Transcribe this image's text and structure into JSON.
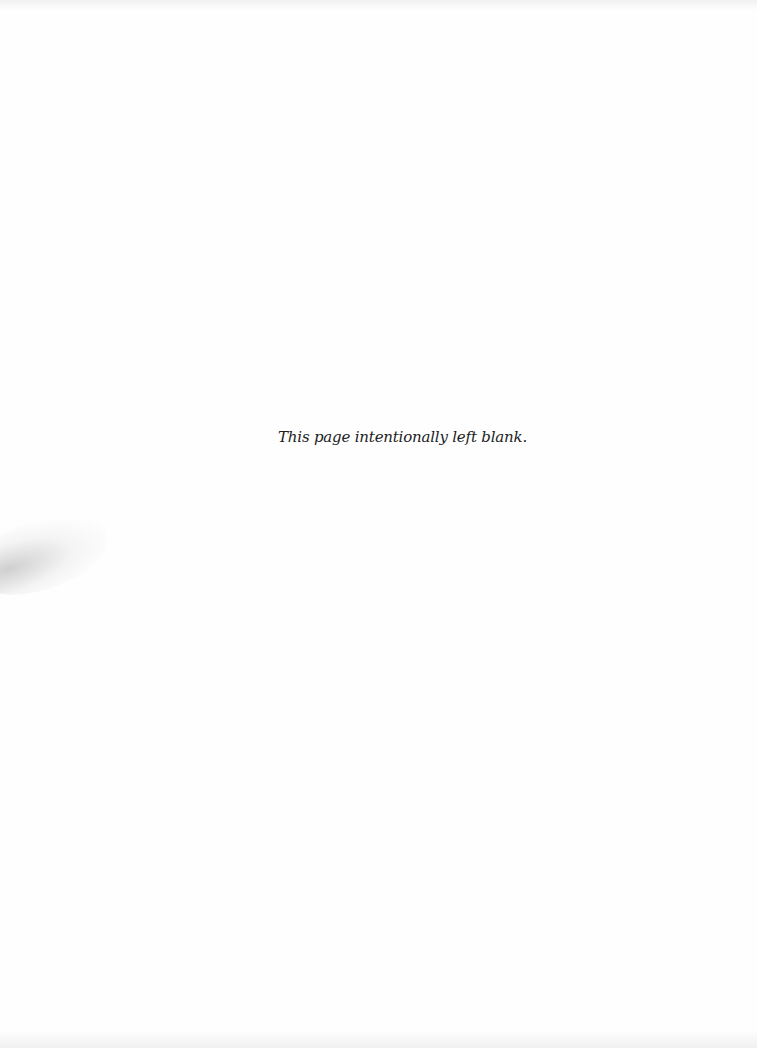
{
  "page": {
    "message": "This page intentionally left blank.",
    "background_color": "#fefefe",
    "text_color": "#222222"
  }
}
